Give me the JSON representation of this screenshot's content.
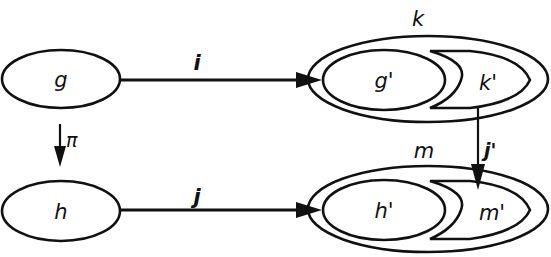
{
  "diagram": {
    "nodes": [
      {
        "id": "g",
        "label": "g"
      },
      {
        "id": "h",
        "label": "h"
      },
      {
        "id": "k",
        "label": "k"
      },
      {
        "id": "g_prime",
        "label": "g'"
      },
      {
        "id": "k_prime",
        "label": "k'"
      },
      {
        "id": "m",
        "label": "m"
      },
      {
        "id": "h_prime",
        "label": "h'"
      },
      {
        "id": "m_prime",
        "label": "m'"
      }
    ],
    "edges": [
      {
        "id": "i",
        "label": "i",
        "from": "g",
        "to": "g'"
      },
      {
        "id": "j",
        "label": "j",
        "from": "h",
        "to": "h'"
      },
      {
        "id": "pi",
        "label": "π",
        "from": "g",
        "to": "h"
      },
      {
        "id": "j_prime",
        "label": "j'",
        "from": "k'",
        "to": "m'"
      }
    ]
  }
}
